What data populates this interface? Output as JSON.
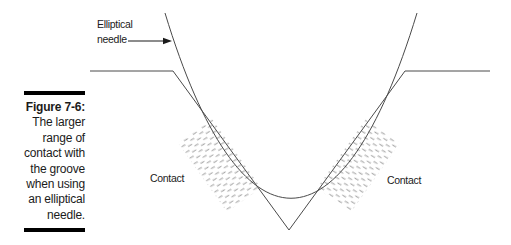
{
  "caption": {
    "label": "Figure 7-6:",
    "lines": [
      "The larger",
      "range of",
      "contact with",
      "the groove",
      "when using",
      "an elliptical",
      "needle."
    ]
  },
  "diagram": {
    "needle_label": {
      "line1": "Elliptical",
      "line2": "needle"
    },
    "contact_left": "Contact",
    "contact_right": "Contact"
  },
  "colors": {
    "line": "#4a4a4a",
    "hatch": "#9f9f9f",
    "text": "#1b1b1b",
    "bar": "#000000",
    "background": "#ffffff"
  }
}
